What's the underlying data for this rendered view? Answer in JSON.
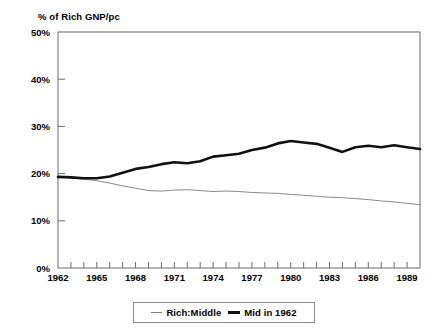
{
  "chart_data": {
    "type": "line",
    "title": "",
    "ylabel": "% of Rich GNP/pc",
    "xlabel": "",
    "ylim": [
      0,
      50
    ],
    "xlim": [
      1962,
      1990
    ],
    "grid": false,
    "legend_position": "bottom-center",
    "y_ticks": [
      "0%",
      "10%",
      "20%",
      "30%",
      "40%",
      "50%"
    ],
    "y_tick_values": [
      0,
      10,
      20,
      30,
      40,
      50
    ],
    "x_ticks": [
      "1962",
      "1965",
      "1968",
      "1971",
      "1974",
      "1977",
      "1980",
      "1983",
      "1986",
      "1989"
    ],
    "x_tick_values": [
      1962,
      1965,
      1968,
      1971,
      1974,
      1977,
      1980,
      1983,
      1986,
      1989
    ],
    "x": [
      1962,
      1963,
      1964,
      1965,
      1966,
      1967,
      1968,
      1969,
      1970,
      1971,
      1972,
      1973,
      1974,
      1975,
      1976,
      1977,
      1978,
      1979,
      1980,
      1981,
      1982,
      1983,
      1984,
      1985,
      1986,
      1987,
      1988,
      1989,
      1990
    ],
    "series": [
      {
        "name": "Rich:Middle",
        "style": "thin",
        "color": "#7d7d7d",
        "values": [
          19.3,
          19.1,
          18.8,
          18.5,
          18.0,
          17.4,
          16.9,
          16.4,
          16.3,
          16.5,
          16.6,
          16.4,
          16.2,
          16.3,
          16.2,
          16.0,
          15.9,
          15.8,
          15.6,
          15.4,
          15.2,
          15.0,
          14.9,
          14.7,
          14.5,
          14.2,
          14.0,
          13.7,
          13.4
        ]
      },
      {
        "name": "Mid in 1962",
        "style": "thick",
        "color": "#111111",
        "values": [
          19.3,
          19.2,
          19.0,
          19.0,
          19.4,
          20.2,
          21.0,
          21.4,
          22.0,
          22.4,
          22.2,
          22.6,
          23.6,
          23.9,
          24.2,
          25.0,
          25.5,
          26.4,
          26.9,
          26.6,
          26.3,
          25.5,
          24.6,
          25.6,
          25.9,
          25.6,
          26.0,
          25.6,
          25.2
        ]
      }
    ]
  },
  "axis": {
    "y_title": "% of Rich GNP/pc"
  },
  "legend": {
    "entries": [
      {
        "label": "Rich:Middle",
        "marker": "thin-line-swatch"
      },
      {
        "label": "Mid in 1962",
        "marker": "thick-line-swatch"
      }
    ]
  },
  "top_strip": {
    "text": ""
  }
}
